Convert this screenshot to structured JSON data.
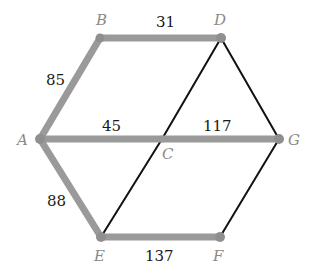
{
  "diagram": {
    "type": "weighted-graph",
    "colors": {
      "highlight_edge": "#9a9a9a",
      "normal_edge": "#111111",
      "node_label": "#8a8a8a",
      "weight_label": "#1a1a1a"
    },
    "nodes": [
      {
        "id": "A",
        "label": "A",
        "x": 40,
        "y": 139
      },
      {
        "id": "B",
        "label": "B",
        "x": 100,
        "y": 38
      },
      {
        "id": "D",
        "label": "D",
        "x": 221,
        "y": 38
      },
      {
        "id": "C",
        "label": "C",
        "x": 162,
        "y": 139
      },
      {
        "id": "G",
        "label": "G",
        "x": 279,
        "y": 139
      },
      {
        "id": "E",
        "label": "E",
        "x": 101,
        "y": 237
      },
      {
        "id": "F",
        "label": "F",
        "x": 220,
        "y": 237
      }
    ],
    "edges": [
      {
        "from": "A",
        "to": "B",
        "weight": "85",
        "highlighted": true
      },
      {
        "from": "B",
        "to": "D",
        "weight": "31",
        "highlighted": true
      },
      {
        "from": "A",
        "to": "C",
        "weight": "45",
        "highlighted": true
      },
      {
        "from": "C",
        "to": "G",
        "weight": "117",
        "highlighted": true
      },
      {
        "from": "A",
        "to": "E",
        "weight": "88",
        "highlighted": true
      },
      {
        "from": "E",
        "to": "F",
        "weight": "137",
        "highlighted": true
      },
      {
        "from": "D",
        "to": "C",
        "weight": "",
        "highlighted": false
      },
      {
        "from": "D",
        "to": "G",
        "weight": "",
        "highlighted": false
      },
      {
        "from": "C",
        "to": "E",
        "weight": "",
        "highlighted": false
      },
      {
        "from": "G",
        "to": "F",
        "weight": "",
        "highlighted": false
      }
    ],
    "labels": {
      "A": "A",
      "B": "B",
      "C": "C",
      "D": "D",
      "E": "E",
      "F": "F",
      "G": "G",
      "w_AB": "85",
      "w_BD": "31",
      "w_AC": "45",
      "w_CG": "117",
      "w_AE": "88",
      "w_EF": "137"
    }
  }
}
